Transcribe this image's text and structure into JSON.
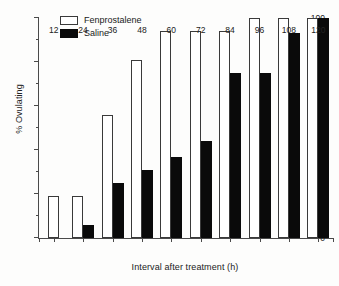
{
  "chart_data": {
    "type": "bar",
    "title": "",
    "xlabel": "Interval after treatment (h)",
    "ylabel": "% Ovulating",
    "categories": [
      "12",
      "24",
      "36",
      "48",
      "60",
      "72",
      "84",
      "96",
      "108",
      "120"
    ],
    "ylim": [
      0,
      100
    ],
    "yticks": [
      0,
      20,
      40,
      60,
      80,
      100
    ],
    "ytick_labels": [
      "0",
      "20",
      "40",
      "60",
      "80",
      "100"
    ],
    "yminor_ticks": [
      10,
      30,
      50,
      70,
      90
    ],
    "grid": false,
    "legend_position": "top-left",
    "series": [
      {
        "name": "Fenprostalene",
        "style": "open",
        "color": "#ffffff",
        "edge_color": "#3a3a3a",
        "values": [
          19,
          19,
          56,
          81,
          94,
          94,
          94,
          100,
          100,
          100
        ]
      },
      {
        "name": "Saline",
        "style": "solid",
        "color": "#0a0a0a",
        "edge_color": "#0a0a0a",
        "values": [
          0,
          6,
          25,
          31,
          37,
          44,
          75,
          75,
          93,
          100
        ]
      }
    ]
  },
  "axes": {
    "y_title": "% Ovulating",
    "x_title": "Interval after treatment (h)"
  },
  "legend": {
    "items": [
      {
        "label": "Fenprostalene",
        "style": "open"
      },
      {
        "label": "Saline",
        "style": "solid"
      }
    ]
  }
}
